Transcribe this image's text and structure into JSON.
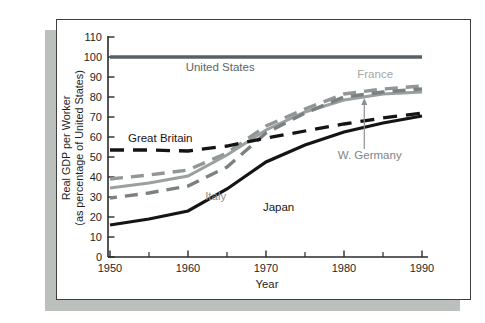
{
  "figure": {
    "background": "#ffffff",
    "card_border_color": "#3f3f3f",
    "card_shadow_color": "#bcc0bc",
    "axis_color": "#2a2a2a",
    "tick_label_color": "#1e1e1e"
  },
  "chart_data": {
    "type": "line",
    "title": "",
    "xlabel": "Year",
    "ylabel_line1": "Real GDP per Worker",
    "ylabel_line2": "(as percentage of United States)",
    "xlim": [
      1950,
      1990
    ],
    "ylim": [
      0,
      110
    ],
    "grid": false,
    "legend": "inline-labels",
    "x": [
      1950,
      1955,
      1960,
      1965,
      1970,
      1975,
      1980,
      1985,
      1990
    ],
    "x_major_ticks": [
      1950,
      1960,
      1970,
      1980,
      1990
    ],
    "x_minor_ticks": [
      1955,
      1965,
      1975,
      1985
    ],
    "y_ticks": [
      0,
      10,
      20,
      30,
      40,
      50,
      60,
      70,
      80,
      90,
      100,
      110
    ],
    "series": [
      {
        "name": "United States",
        "values": [
          100,
          100,
          100,
          100,
          100,
          100,
          100,
          100,
          100
        ],
        "color": "#566165",
        "dash": "none",
        "width": 3.6,
        "label": {
          "text": "United States",
          "x": 1959.7,
          "y": 93,
          "color": "#5c666a"
        }
      },
      {
        "name": "France",
        "values": [
          39,
          41,
          43.5,
          52,
          65.5,
          74,
          81.5,
          84,
          85.5
        ],
        "color": "#919696",
        "dash": "13 8",
        "width": 3.4,
        "label": {
          "text": "France",
          "x": 1981.7,
          "y": 89.5,
          "color": "#a3a8a8"
        }
      },
      {
        "name": "W. Germany",
        "values": [
          34.5,
          37,
          40.5,
          51,
          63.5,
          72.5,
          78.5,
          81.5,
          82.5
        ],
        "color": "#9aa0a0",
        "dash": "none",
        "width": 3.0,
        "label": {
          "text": "W. Germany",
          "x": 1979.2,
          "y": 49,
          "color": "#7e8486"
        }
      },
      {
        "name": "Italy",
        "values": [
          29.5,
          32,
          35.5,
          45,
          62,
          72,
          80,
          82.5,
          84
        ],
        "color": "#7b8082",
        "dash": "13 8",
        "width": 3.4,
        "label": {
          "text": "Italy",
          "x": 1962.2,
          "y": 28.5,
          "color": "#8d9294"
        }
      },
      {
        "name": "Great Britain",
        "values": [
          53.5,
          53.5,
          53,
          55.5,
          59.5,
          63,
          66.5,
          69.5,
          72
        ],
        "color": "#141414",
        "dash": "14 9",
        "width": 3.3,
        "label": {
          "text": "Great Britain",
          "x": 1952.3,
          "y": 57.5,
          "color": "#161616"
        }
      },
      {
        "name": "Japan",
        "values": [
          16,
          19,
          23,
          34,
          47.5,
          56,
          62.5,
          67,
          70.5
        ],
        "color": "#141414",
        "dash": "none",
        "width": 3.2,
        "label": {
          "text": "Japan",
          "x": 1969.6,
          "y": 23,
          "color": "#161616"
        }
      }
    ],
    "annotation_arrow": {
      "points_to": "W. Germany",
      "x": 1982.6,
      "from_y": 54,
      "to_y": 79.5,
      "color": "#8a8f91"
    }
  }
}
